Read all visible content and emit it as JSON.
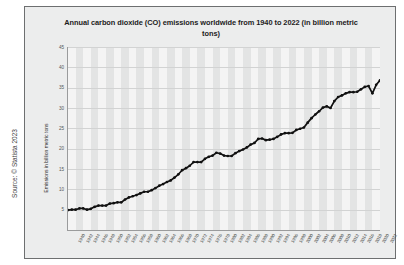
{
  "source_credit": "Source: © Statista 2023",
  "chart_data": {
    "type": "line",
    "title": "Annual carbon dioxide (CO) emissions worldwide from 1940 to 2022 (in billion metric tons)",
    "xlabel": "",
    "ylabel": "Emissions in billion metric tons",
    "ylim": [
      0,
      45
    ],
    "yticks": [
      45,
      40,
      35,
      30,
      25,
      20,
      15,
      10,
      5
    ],
    "grid": true,
    "legend": "none",
    "series_name": "Annual CO2 emissions",
    "line_color": "#111111",
    "marker_color": "#111111",
    "x": [
      1940,
      1941,
      1942,
      1943,
      1944,
      1945,
      1946,
      1947,
      1948,
      1949,
      1950,
      1951,
      1952,
      1953,
      1954,
      1955,
      1956,
      1957,
      1958,
      1959,
      1960,
      1961,
      1962,
      1963,
      1964,
      1965,
      1966,
      1967,
      1968,
      1969,
      1970,
      1971,
      1972,
      1973,
      1974,
      1975,
      1976,
      1977,
      1978,
      1979,
      1980,
      1981,
      1982,
      1983,
      1984,
      1985,
      1986,
      1987,
      1988,
      1989,
      1990,
      1991,
      1992,
      1993,
      1994,
      1995,
      1996,
      1997,
      1998,
      1999,
      2000,
      2001,
      2002,
      2003,
      2004,
      2005,
      2006,
      2007,
      2008,
      2009,
      2010,
      2011,
      2012,
      2013,
      2014,
      2015,
      2016,
      2017,
      2018,
      2019,
      2020,
      2021,
      2022
    ],
    "values": [
      4.9,
      5.0,
      5.0,
      5.3,
      5.3,
      5.0,
      5.2,
      5.7,
      6.0,
      6.0,
      6.0,
      6.5,
      6.6,
      6.8,
      6.8,
      7.5,
      8.0,
      8.3,
      8.6,
      9.0,
      9.4,
      9.4,
      9.8,
      10.3,
      10.9,
      11.3,
      11.8,
      12.2,
      12.9,
      13.7,
      14.7,
      15.2,
      15.8,
      16.7,
      16.7,
      16.7,
      17.5,
      18.0,
      18.3,
      19.0,
      18.8,
      18.3,
      18.2,
      18.2,
      18.9,
      19.4,
      19.8,
      20.3,
      21.0,
      21.4,
      22.4,
      22.5,
      22.1,
      22.2,
      22.4,
      22.9,
      23.5,
      23.8,
      23.8,
      23.9,
      24.6,
      24.9,
      25.2,
      26.4,
      27.5,
      28.4,
      29.2,
      30.1,
      30.4,
      30.0,
      31.7,
      32.7,
      33.1,
      33.6,
      33.9,
      33.9,
      34.0,
      34.6,
      35.2,
      35.4,
      33.6,
      35.7,
      36.8
    ]
  },
  "xtick_labels": [
    "1940",
    "1942",
    "1944",
    "1946",
    "1948",
    "1950",
    "1952",
    "1954",
    "1956",
    "1958",
    "1960",
    "1962",
    "1964",
    "1966",
    "1968",
    "1970",
    "1972",
    "1974",
    "1976",
    "1978",
    "1980",
    "1982",
    "1984",
    "1986",
    "1988",
    "1990",
    "1992",
    "1994",
    "1996",
    "1998",
    "2000",
    "2002",
    "2004",
    "2006",
    "2008",
    "2010",
    "2012",
    "2014",
    "2016",
    "2018",
    "2020",
    "2022"
  ]
}
